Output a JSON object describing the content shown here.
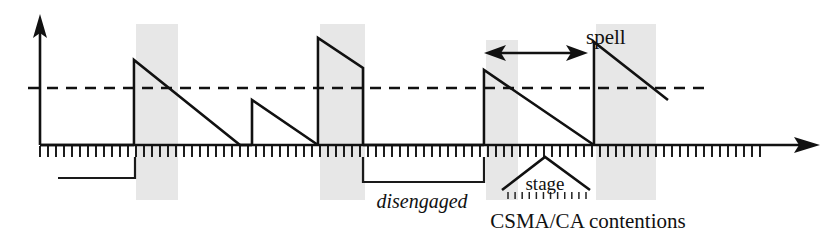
{
  "figure": {
    "title": "",
    "background_color": "#ffffff",
    "ink_color": "#111111",
    "band_color": "#d9d9d9",
    "width": 839,
    "height": 237
  },
  "labels": {
    "spell": "spell",
    "stage": "stage",
    "disengaged": "disengaged",
    "csma_contentions": "CSMA/CA contentions"
  },
  "axes": {
    "y_axis": {
      "name": "vertical-axis",
      "x": 40,
      "y_top": 18,
      "y_bottom": 145,
      "arrow": "up"
    },
    "x_axis": {
      "name": "time-axis",
      "y": 145,
      "x_start": 40,
      "x_end": 818,
      "arrow": "right",
      "tick_start": 40,
      "tick_end": 763,
      "tick_spacing": 8,
      "tick_length": 12
    },
    "threshold_line": {
      "name": "threshold-dashed-line",
      "y": 88,
      "x_start": 28,
      "x_end": 708,
      "style": "dashed"
    }
  },
  "chart_data": {
    "type": "line",
    "title": "",
    "xlabel": "",
    "ylabel": "",
    "grid": false,
    "legend": null,
    "series": [
      {
        "name": "backoff-sawtooth-waveform",
        "description": "Piecewise sawtooth: vertical rise at contention, linear decay over time",
        "points": [
          [
            40,
            145
          ],
          [
            134,
            145
          ],
          [
            134,
            60
          ],
          [
            240,
            145
          ],
          [
            252,
            145
          ],
          [
            252,
            100
          ],
          [
            318,
            145
          ],
          [
            318,
            145
          ],
          [
            318,
            38
          ],
          [
            363,
            68
          ],
          [
            363,
            145
          ],
          [
            484,
            145
          ],
          [
            484,
            70
          ],
          [
            594,
            145
          ],
          [
            594,
            145
          ],
          [
            594,
            42
          ],
          [
            668,
            100
          ]
        ]
      }
    ],
    "engagement_segments": [
      {
        "name": "disengaged-segment-1",
        "x_start": 58,
        "x_end": 135,
        "y": 178
      },
      {
        "name": "disengaged-segment-2",
        "x_start": 363,
        "x_end": 484,
        "y": 182
      }
    ],
    "contention_bands": [
      {
        "name": "contention-band-1",
        "x": 136,
        "width": 42,
        "y_top": 24,
        "y_bottom": 200
      },
      {
        "name": "contention-band-2",
        "x": 320,
        "width": 45,
        "y_top": 24,
        "y_bottom": 200
      },
      {
        "name": "contention-band-3",
        "x": 486,
        "width": 32,
        "y_top": 40,
        "y_bottom": 200
      },
      {
        "name": "contention-band-4",
        "x": 596,
        "width": 60,
        "y_top": 24,
        "y_bottom": 200
      }
    ],
    "spell_measure": {
      "name": "spell-span",
      "x_start": 486,
      "x_end": 585,
      "y": 53,
      "label": "spell"
    },
    "stage_bracket": {
      "name": "stage-caret",
      "apex_x": 545,
      "apex_y": 157,
      "left_x": 502,
      "right_x": 590,
      "base_y": 190,
      "minitick_y_top": 192,
      "minitick_y_bottom": 199,
      "minitick_count": 12
    }
  }
}
